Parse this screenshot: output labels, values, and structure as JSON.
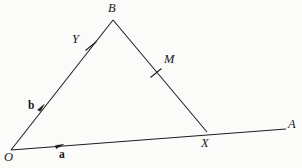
{
  "figure": {
    "background_color": "#fbfbfa",
    "stroke_color": "#1d1d1d",
    "labels": {
      "origin": "O",
      "apex": "B",
      "ray_end": "A",
      "intersection": "X",
      "midpoint_ob": "Y",
      "midpoint_bx": "M",
      "vector_a": "a",
      "vector_b": "b"
    },
    "points": {
      "O": {
        "x": 11,
        "y": 150
      },
      "B": {
        "x": 113,
        "y": 20
      },
      "X": {
        "x": 207,
        "y": 132
      },
      "A": {
        "x": 286,
        "y": 129
      },
      "Y_tick": {
        "x": 91,
        "y": 46
      },
      "M_tick": {
        "x": 156,
        "y": 73
      },
      "arrow_a_head": {
        "x": 62,
        "y": 145
      },
      "arrow_b_head": {
        "x": 43,
        "y": 106
      }
    },
    "label_positions": {
      "O": {
        "x": 4,
        "y": 151
      },
      "B": {
        "x": 108,
        "y": 2
      },
      "A": {
        "x": 288,
        "y": 118
      },
      "X": {
        "x": 201,
        "y": 137
      },
      "Y": {
        "x": 72,
        "y": 33
      },
      "M": {
        "x": 164,
        "y": 53
      },
      "a": {
        "x": 59,
        "y": 149
      },
      "b": {
        "x": 28,
        "y": 100
      }
    },
    "segments": [
      {
        "name": "ray-OA",
        "from": "O",
        "to": "A"
      },
      {
        "name": "side-OB",
        "from": "O",
        "to": "B"
      },
      {
        "name": "side-BX",
        "from": "B",
        "to": "X"
      }
    ],
    "tick_marks": [
      {
        "name": "tick-on-OB",
        "label": "Y"
      },
      {
        "name": "tick-on-BX",
        "label": "M"
      }
    ]
  }
}
